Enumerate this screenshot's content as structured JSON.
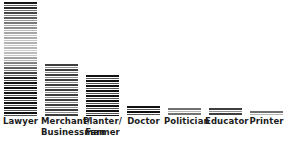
{
  "chart_data": {
    "type": "bar",
    "title": "",
    "subtitle": "",
    "xlabel": "",
    "ylabel": "",
    "grid": false,
    "legend": null,
    "orientation": "vertical",
    "ylim": [
      0,
      100
    ],
    "categories": [
      "Lawyer",
      "Merchant/ Businessman",
      "Planter/ Farmer",
      "Doctor",
      "Politician",
      "Educator",
      "Printer"
    ],
    "values": [
      100,
      46,
      36,
      9,
      7,
      7,
      4
    ],
    "series": [
      {
        "name": "",
        "values": [
          100,
          46,
          36,
          9,
          7,
          7,
          4
        ]
      }
    ]
  },
  "chart": {
    "bars": [
      {
        "label_line1": "Lawyer",
        "label_line2": "",
        "value": 100,
        "tone": "tone-dark",
        "faded": true
      },
      {
        "label_line1": "Merchant/",
        "label_line2": "Businessman",
        "value": 46,
        "tone": "tone-mid",
        "faded": false
      },
      {
        "label_line1": "Planter/",
        "label_line2": "Farmer",
        "value": 36,
        "tone": "tone-dark",
        "faded": false
      },
      {
        "label_line1": "Doctor",
        "label_line2": "",
        "value": 9,
        "tone": "tone-dark",
        "faded": false
      },
      {
        "label_line1": "Politician",
        "label_line2": "",
        "value": 7,
        "tone": "tone-light",
        "faded": false
      },
      {
        "label_line1": "Educator",
        "label_line2": "",
        "value": 7,
        "tone": "tone-mid",
        "faded": false
      },
      {
        "label_line1": "Printer",
        "label_line2": "",
        "value": 4,
        "tone": "tone-light",
        "faded": false
      }
    ]
  }
}
